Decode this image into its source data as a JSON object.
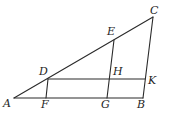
{
  "diagram": {
    "type": "geometry-figure",
    "points": {
      "A": {
        "label": "A",
        "x": 14,
        "y": 98,
        "lx": 3,
        "ly": 107
      },
      "B": {
        "label": "B",
        "x": 143,
        "y": 98,
        "lx": 137,
        "ly": 108
      },
      "C": {
        "label": "C",
        "x": 153,
        "y": 17,
        "lx": 150,
        "ly": 14
      },
      "D": {
        "label": "D",
        "x": 48,
        "y": 79,
        "lx": 39,
        "ly": 75
      },
      "E": {
        "label": "E",
        "x": 114,
        "y": 40,
        "lx": 107,
        "ly": 35
      },
      "F": {
        "label": "F",
        "x": 46,
        "y": 98,
        "lx": 41,
        "ly": 108
      },
      "G": {
        "label": "G",
        "x": 107,
        "y": 98,
        "lx": 101,
        "ly": 108
      },
      "H": {
        "label": "H",
        "x": 110,
        "y": 79,
        "lx": 113,
        "ly": 75
      },
      "K": {
        "label": "K",
        "x": 145,
        "y": 79,
        "lx": 148,
        "ly": 84
      }
    },
    "segments": [
      {
        "name": "segment-AC",
        "from": "A",
        "to": "C"
      },
      {
        "name": "segment-AB",
        "from": "A",
        "to": "B"
      },
      {
        "name": "segment-BC",
        "from": "B",
        "to": "C"
      },
      {
        "name": "segment-DK",
        "from": "D",
        "to": "K"
      },
      {
        "name": "segment-DF",
        "from": "D",
        "to": "F"
      },
      {
        "name": "segment-EG",
        "from": "E",
        "to": "G"
      }
    ]
  }
}
